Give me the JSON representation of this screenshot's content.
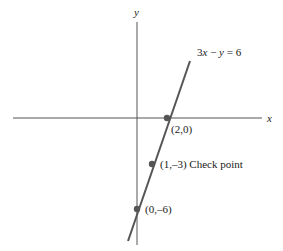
{
  "diagram": {
    "type": "coordinate-graph",
    "axes": {
      "x_label": "x",
      "y_label": "y",
      "axis_color": "#555555"
    },
    "line": {
      "equation_label": "3x − y = 6",
      "equation_parts": {
        "a": "3",
        "x": "x",
        "minus": " − ",
        "y": "y",
        "eq": " = 6"
      },
      "color": "#555555"
    },
    "points": [
      {
        "label": "(2,0)",
        "x": 2,
        "y": 0
      },
      {
        "label": "(1,–3) Check point",
        "x": 1,
        "y": -3
      },
      {
        "label": "(0,–6)",
        "x": 0,
        "y": -6
      }
    ],
    "point_color": "#555555"
  }
}
